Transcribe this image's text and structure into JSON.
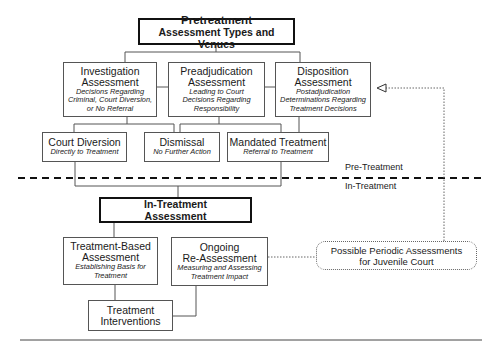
{
  "pretreatment": {
    "title_line1": "Pretreatment",
    "title_line2": "Assessment Types and Venues"
  },
  "investigation": {
    "title_line1": "Investigation",
    "title_line2": "Assessment",
    "desc_line1": "Decisions Regarding",
    "desc_line2": "Criminal, Court Diversion,",
    "desc_line3": "or No Referral"
  },
  "preadjudication": {
    "title_line1": "Preadjudication",
    "title_line2": "Assessment",
    "desc_line1": "Leading to Court",
    "desc_line2": "Decisions Regarding",
    "desc_line3": "Responsibility"
  },
  "disposition": {
    "title_line1": "Disposition",
    "title_line2": "Assessment",
    "desc_line1": "Postadjudication",
    "desc_line2": "Determinations Regarding",
    "desc_line3": "Treatment Decisions"
  },
  "court_diversion": {
    "title": "Court Diversion",
    "desc": "Directly to Treatment"
  },
  "dismissal": {
    "title": "Dismissal",
    "desc": "No Further Action"
  },
  "mandated_treatment": {
    "title": "Mandated Treatment",
    "desc": "Referral to Treatment"
  },
  "divider": {
    "above_label": "Pre-Treatment",
    "below_label": "In-Treatment"
  },
  "in_treatment": {
    "title_line1": "In-Treatment",
    "title_line2": "Assessment"
  },
  "treatment_based": {
    "title_line1": "Treatment-Based",
    "title_line2": "Assessment",
    "desc_line1": "Establishing Basis for",
    "desc_line2": "Treatment"
  },
  "ongoing": {
    "title_line1": "Ongoing",
    "title_line2": "Re-Assessment",
    "desc_line1": "Measuring and Assessing",
    "desc_line2": "Treatment Impact"
  },
  "interventions": {
    "title_line1": "Treatment",
    "title_line2": "Interventions"
  },
  "periodic": {
    "line1": "Possible Periodic Assessments",
    "line2": "for Juvenile Court"
  },
  "colors": {
    "line": "#555555",
    "border_strong": "#111111",
    "text": "#1a1a1a"
  }
}
